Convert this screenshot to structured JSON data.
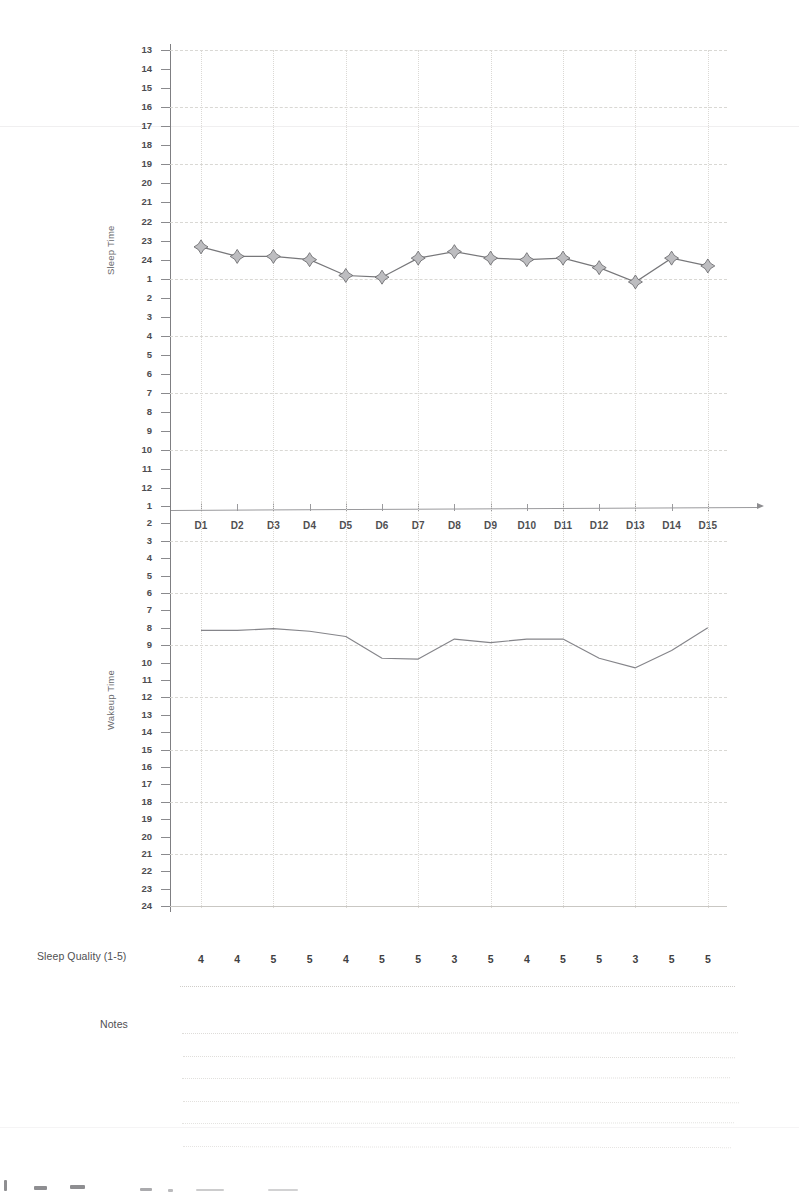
{
  "document": {
    "title": "Sleep Tracking Log",
    "sleep_quality_label": "Sleep Quality (1-5)",
    "notes_label": "Notes",
    "notes_line_count": 6
  },
  "chart_data": [
    {
      "type": "line",
      "title": "Sleep Time",
      "ylabel": "Sleep Time",
      "xlabel": "",
      "grid": true,
      "legend": "none",
      "marker": "four-point-star",
      "categories": [
        "D1",
        "D2",
        "D3",
        "D4",
        "D5",
        "D6",
        "D7",
        "D8",
        "D9",
        "D10",
        "D11",
        "D12",
        "D13",
        "D14",
        "D15"
      ],
      "ytick_labels": [
        "13",
        "14",
        "15",
        "16",
        "17",
        "18",
        "19",
        "20",
        "21",
        "22",
        "23",
        "24",
        "1",
        "2",
        "3",
        "4",
        "5",
        "6",
        "7",
        "8",
        "9",
        "10",
        "11",
        "12"
      ],
      "yaxis_note": "clock hours 13:00 through 12:00 (next day), descending down the axis",
      "values_clock": [
        "23:20",
        "23:50",
        "23:50",
        "24:00",
        "00:50",
        "00:55",
        "23:55",
        "23:35",
        "23:55",
        "24:00",
        "23:55",
        "00:25",
        "01:10",
        "23:55",
        "00:20"
      ],
      "values": [
        23.33,
        23.83,
        23.83,
        24.0,
        24.83,
        24.92,
        23.92,
        23.58,
        23.92,
        24.0,
        23.92,
        24.42,
        25.17,
        23.92,
        24.33
      ],
      "ylim": [
        13,
        37
      ]
    },
    {
      "type": "line",
      "title": "Wakeup Time",
      "ylabel": "Wakeup Time",
      "xlabel": "",
      "grid": true,
      "legend": "none",
      "marker": "none",
      "categories": [
        "D1",
        "D2",
        "D3",
        "D4",
        "D5",
        "D6",
        "D7",
        "D8",
        "D9",
        "D10",
        "D11",
        "D12",
        "D13",
        "D14",
        "D15"
      ],
      "ytick_labels": [
        "1",
        "2",
        "3",
        "4",
        "5",
        "6",
        "7",
        "8",
        "9",
        "10",
        "11",
        "12",
        "13",
        "14",
        "15",
        "16",
        "17",
        "18",
        "19",
        "20",
        "21",
        "22",
        "23",
        "24"
      ],
      "values_clock": [
        "08:10",
        "08:10",
        "08:05",
        "08:10",
        "08:30",
        "09:45",
        "09:50",
        "08:40",
        "08:50",
        "08:40",
        "08:40",
        "09:45",
        "10:15",
        "09:20",
        "08:00"
      ],
      "values": [
        8.15,
        8.15,
        8.05,
        8.2,
        8.5,
        9.75,
        9.8,
        8.65,
        8.85,
        8.65,
        8.65,
        9.75,
        10.3,
        9.3,
        8.0
      ],
      "ylim": [
        1,
        24
      ]
    },
    {
      "type": "table",
      "title": "Sleep Quality (1-5)",
      "categories": [
        "D1",
        "D2",
        "D3",
        "D4",
        "D5",
        "D6",
        "D7",
        "D8",
        "D9",
        "D10",
        "D11",
        "D12",
        "D13",
        "D14",
        "D15"
      ],
      "values": [
        4,
        4,
        5,
        5,
        4,
        5,
        5,
        3,
        5,
        4,
        5,
        5,
        3,
        5,
        5
      ],
      "ylim": [
        1,
        5
      ]
    }
  ]
}
